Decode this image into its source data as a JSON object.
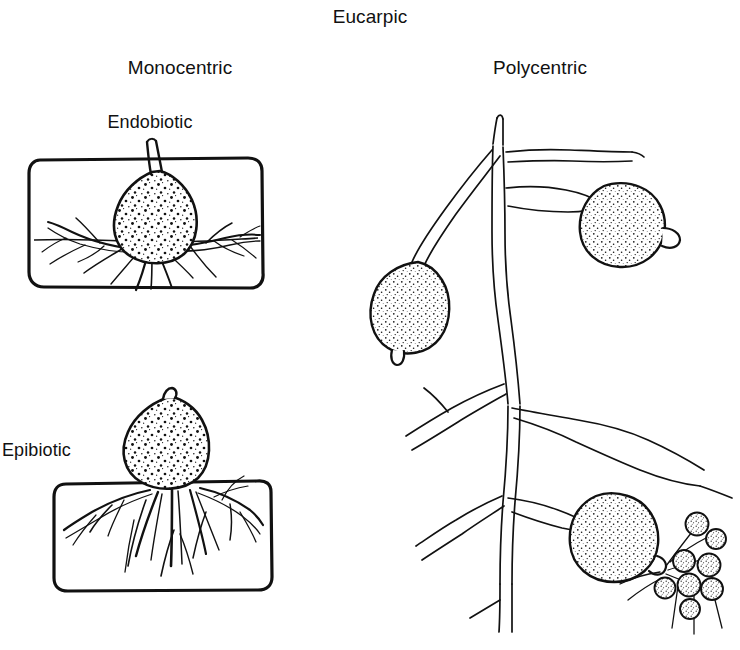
{
  "figure": {
    "title": "Eucarpic",
    "background_color": "#ffffff",
    "ink_color": "#111111",
    "columns": {
      "monocentric": "Monocentric",
      "polycentric": "Polycentric"
    },
    "monocentric_rows": {
      "endobiotic": "Endobiotic",
      "epibiotic": "Epibiotic"
    },
    "structures": {
      "host_cell_wall": "host-cell-boundary",
      "sporangium": "sporangium",
      "rhizoids": "rhizoid-system",
      "hypha": "hypha",
      "discharge_papilla": "discharge-papilla",
      "zoospore": "zoospore",
      "flagellum": "flagellum"
    },
    "counts": {
      "monocentric_panels": 2,
      "polycentric_sporangia": 3,
      "zoospores_released": 8
    }
  }
}
